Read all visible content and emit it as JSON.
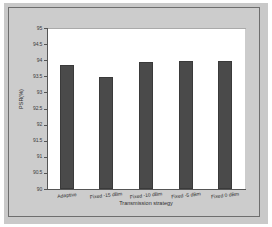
{
  "chart_data": {
    "type": "bar",
    "title": "",
    "xlabel": "Transmission strategy",
    "ylabel": "PSR(%)",
    "categories": [
      "Adaptive",
      "Fixed -15 dBm",
      "Fixed -10 dBm",
      "Fixed -5 dBm",
      "Fixed 0 dBm"
    ],
    "values": [
      93.86,
      93.47,
      93.95,
      93.96,
      93.96
    ],
    "ylim": [
      90,
      95
    ],
    "yticks": [
      90,
      90.5,
      91,
      91.5,
      92,
      92.5,
      93,
      93.5,
      94,
      94.5,
      95
    ],
    "ytick_labels": [
      "90",
      "90.5",
      "91",
      "91.5",
      "92",
      "92.5",
      "93",
      "93.5",
      "94",
      "94.5",
      "95"
    ],
    "grid": false,
    "legend": null,
    "bar_color": "#4a4a4a",
    "plot_background": "#ffffff",
    "figure_background": "#cccccc",
    "axis_color": "#555555"
  }
}
